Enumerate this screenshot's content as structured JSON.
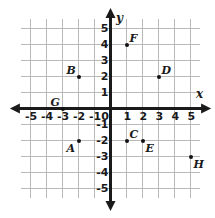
{
  "chart_data": {
    "type": "scatter",
    "title": "",
    "xlabel": "x",
    "ylabel": "y",
    "xlim": [
      -5.6,
      5.6
    ],
    "ylim": [
      -5.6,
      5.6
    ],
    "grid": true,
    "legend": "none",
    "x_ticks": [
      "-5",
      "-4",
      "-3",
      "-2",
      "-1",
      "0",
      "1",
      "2",
      "3",
      "4",
      "5"
    ],
    "x_tick_values": [
      -5,
      -4,
      -3,
      -2,
      -1,
      0,
      1,
      2,
      3,
      4,
      5
    ],
    "y_ticks": [
      "5",
      "4",
      "3",
      "2",
      "1",
      "0",
      "-1",
      "-2",
      "-3",
      "-4",
      "-5"
    ],
    "y_tick_values": [
      5,
      4,
      3,
      2,
      1,
      0,
      -1,
      -2,
      -3,
      -4,
      -5
    ],
    "points": [
      {
        "label": "A",
        "x": -2,
        "y": -2,
        "label_pos": "left-below"
      },
      {
        "label": "B",
        "x": -2,
        "y": 2,
        "label_pos": "left-above"
      },
      {
        "label": "C",
        "x": 1,
        "y": -2,
        "label_pos": "right-above"
      },
      {
        "label": "D",
        "x": 3,
        "y": 2,
        "label_pos": "right-above"
      },
      {
        "label": "E",
        "x": 2,
        "y": -2,
        "label_pos": "right-below"
      },
      {
        "label": "F",
        "x": 1,
        "y": 4,
        "label_pos": "right-above"
      },
      {
        "label": "G",
        "x": -3,
        "y": 0,
        "label_pos": "left-above"
      },
      {
        "label": "H",
        "x": 5,
        "y": -3,
        "label_pos": "right-below"
      }
    ]
  },
  "axes": {
    "x_axis_label": "x",
    "y_axis_label": "y",
    "origin_label": "0"
  },
  "colors": {
    "grid": "#b9b9b9",
    "axis": "#1a1a1a",
    "point": "#111111",
    "background": "#ffffff"
  }
}
